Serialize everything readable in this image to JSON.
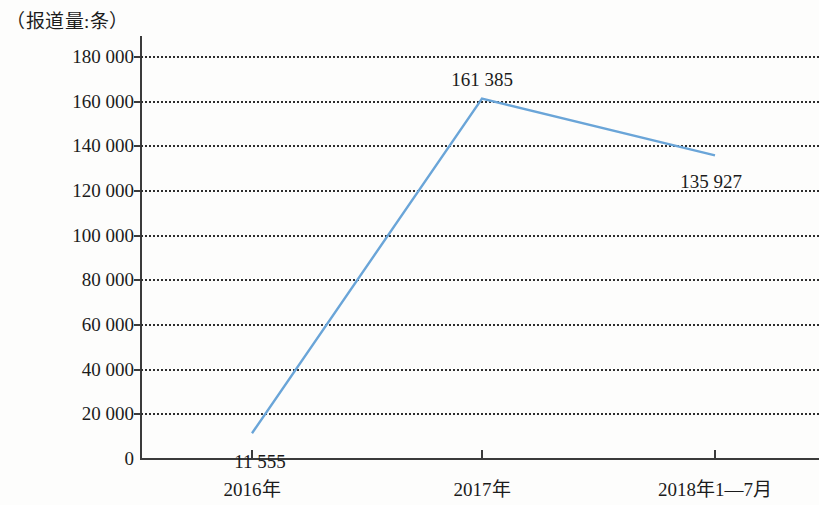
{
  "chart_data": {
    "type": "line",
    "title": "（报道量:条）",
    "xlabel": "",
    "ylabel": "报道量:条",
    "categories": [
      "2016年",
      "2017年",
      "2018年1—7月"
    ],
    "values": [
      11555,
      161385,
      135927
    ],
    "point_labels": [
      "11 555",
      "161 385",
      "135 927"
    ],
    "series": [
      {
        "name": "报道量",
        "values": [
          11555,
          161385,
          135927
        ],
        "color": "#6aa5d8"
      }
    ],
    "ylim": [
      0,
      180000
    ],
    "ytick_values": [
      0,
      20000,
      40000,
      60000,
      80000,
      100000,
      120000,
      140000,
      160000,
      180000
    ],
    "ytick_labels": [
      "0",
      "20 000",
      "40 000",
      "60 000",
      "80 000",
      "100 000",
      "120 000",
      "140 000",
      "160 000",
      "180 000"
    ],
    "grid": true,
    "grid_style": "dotted",
    "grid_color": "#2e2e2e",
    "legend": false,
    "legend_position": "none",
    "axis_color": "#3b3b3b",
    "background_color": "#fdfdfc",
    "text_color": "#1b1b1b"
  }
}
